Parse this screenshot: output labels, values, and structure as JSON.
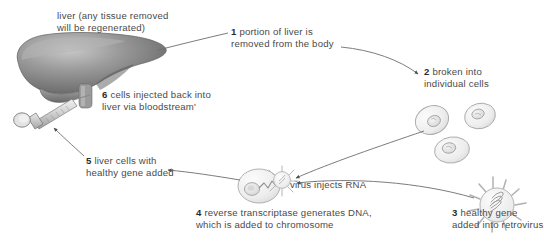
{
  "diagram": {
    "colors": {
      "text": "#4a4a4a",
      "bold_text": "#2b2b2b",
      "arrow": "#5a5a5a",
      "liver_dark": "#6f6f6f",
      "liver_light": "#b9b9b9",
      "cell_fill": "#f2f2f2",
      "cell_stroke": "#a8a8a8",
      "syringe": "#cfcfcf",
      "background": "#ffffff"
    },
    "labels": {
      "liver_note_line1": "liver (any tissue removed",
      "liver_note_line2": "will be regenerated)",
      "step1_num": "1",
      "step1_line1": " portion of liver is",
      "step1_line2": "removed from the body",
      "step2_num": "2",
      "step2_line1": " broken into",
      "step2_line2": "individual cells",
      "step3_num": "3",
      "step3_line1": " healthy gene",
      "step3_line2": "added into retrovirus",
      "step4_num": "4",
      "step4_line1": " reverse transcriptase generates DNA,",
      "step4_line2": "which is added to chromosome",
      "step5_num": "5",
      "step5_line1": " liver cells with",
      "step5_line2": "healthy gene added",
      "step6_num": "6",
      "step6_line1": " cells injected back into",
      "step6_line2": "liver via bloodstream'",
      "virus_injects_rna": "virus injects RNA"
    },
    "shapes": {
      "liver": "liver-organ",
      "syringe": "syringe",
      "cells": [
        "liver-cell-1",
        "liver-cell-2",
        "liver-cell-3"
      ],
      "retrovirus": "retrovirus-particle",
      "target_cell": "liver-cell-with-virus",
      "rna_strand": "rna-zigzag"
    },
    "arrows": [
      {
        "name": "arrow-liver-to-step1",
        "from": "liver",
        "to": "step-1-label"
      },
      {
        "name": "arrow-step1-to-cells",
        "from": "step-1-label",
        "to": "individual-cells"
      },
      {
        "name": "arrow-cells-to-target-cell",
        "from": "individual-cells",
        "to": "target-cell"
      },
      {
        "name": "arrow-retrovirus-to-target-cell",
        "from": "retrovirus",
        "to": "target-cell"
      },
      {
        "name": "arrow-target-cell-to-step5",
        "from": "target-cell",
        "to": "step-5-label"
      },
      {
        "name": "arrow-step5-to-syringe",
        "from": "step-5-label",
        "to": "syringe"
      }
    ]
  }
}
